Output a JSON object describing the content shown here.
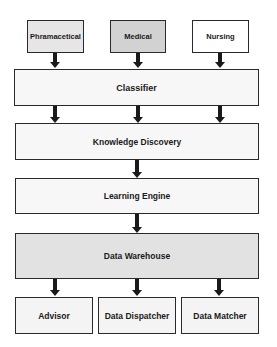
{
  "diagram": {
    "sources": [
      {
        "label": "Phramacetical",
        "fill": "#e6e6e6"
      },
      {
        "label": "Medical",
        "fill": "#d2d2d2"
      },
      {
        "label": "Nursing",
        "fill": "#ffffff"
      }
    ],
    "layers": [
      {
        "label": "Classifier",
        "fill": "#f7f7f7"
      },
      {
        "label": "Knowledge Discovery",
        "fill": "#f7f7f7"
      },
      {
        "label": "Learning Engine",
        "fill": "#f7f7f7"
      },
      {
        "label": "Data Warehouse",
        "fill": "#e2e2e2"
      }
    ],
    "outputs": [
      {
        "label": "Advisor",
        "fill": "#f4f4f4"
      },
      {
        "label": "Data Dispatcher",
        "fill": "#f4f4f4"
      },
      {
        "label": "Data Matcher",
        "fill": "#f4f4f4"
      }
    ],
    "colors": {
      "border": "#2a2a2a",
      "arrow": "#1a1a1a"
    }
  }
}
